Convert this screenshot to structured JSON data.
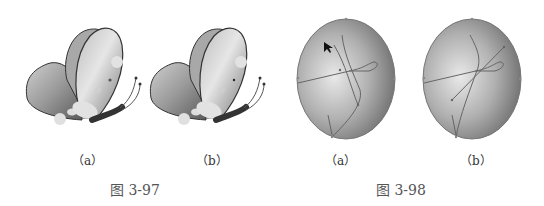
{
  "figures": [
    {
      "title": "图 3-97",
      "subject": "butterfly",
      "panels": [
        {
          "label": "（a）"
        },
        {
          "label": "（b）"
        }
      ]
    },
    {
      "title": "图 3-98",
      "subject": "egg-shape-with-paths",
      "panels": [
        {
          "label": "（a）"
        },
        {
          "label": "（b）"
        }
      ]
    }
  ]
}
